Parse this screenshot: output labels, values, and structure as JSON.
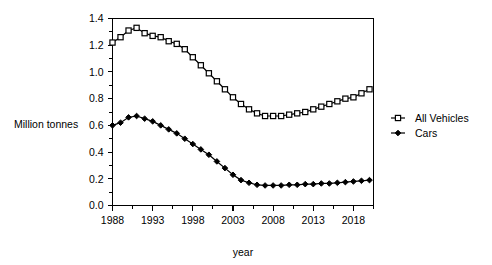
{
  "chart_data": {
    "type": "line",
    "title": "",
    "xlabel": "year",
    "ylabel": "Million tonnes",
    "xlim": [
      1988,
      2020.5
    ],
    "ylim": [
      0.0,
      1.4
    ],
    "grid": false,
    "legend_position": "right",
    "x_ticks": [
      "1988",
      "1993",
      "1998",
      "2003",
      "2008",
      "2013",
      "2018"
    ],
    "x_tick_values": [
      1988,
      1993,
      1998,
      2003,
      2008,
      2013,
      2018
    ],
    "x_minor_step": 2.5,
    "y_ticks": [
      "0.0",
      "0.2",
      "0.4",
      "0.6",
      "0.8",
      "1.0",
      "1.2",
      "1.4"
    ],
    "y_tick_values": [
      0.0,
      0.2,
      0.4,
      0.6,
      0.8,
      1.0,
      1.2,
      1.4
    ],
    "y_minor_step": 0.1,
    "x": [
      1988,
      1989,
      1990,
      1991,
      1992,
      1993,
      1994,
      1995,
      1996,
      1997,
      1998,
      1999,
      2000,
      2001,
      2002,
      2003,
      2004,
      2005,
      2006,
      2007,
      2008,
      2009,
      2010,
      2011,
      2012,
      2013,
      2014,
      2015,
      2016,
      2017,
      2018,
      2019,
      2020
    ],
    "series": [
      {
        "name": "All Vehicles",
        "marker": "open-square",
        "color": "#000000",
        "values": [
          1.22,
          1.26,
          1.31,
          1.33,
          1.29,
          1.27,
          1.26,
          1.23,
          1.21,
          1.17,
          1.11,
          1.05,
          0.99,
          0.93,
          0.87,
          0.81,
          0.76,
          0.72,
          0.69,
          0.67,
          0.67,
          0.67,
          0.68,
          0.69,
          0.7,
          0.72,
          0.74,
          0.76,
          0.78,
          0.8,
          0.81,
          0.84,
          0.87
        ]
      },
      {
        "name": "Cars",
        "marker": "filled-diamond",
        "color": "#000000",
        "values": [
          0.6,
          0.62,
          0.66,
          0.67,
          0.65,
          0.63,
          0.6,
          0.57,
          0.54,
          0.5,
          0.46,
          0.42,
          0.38,
          0.33,
          0.28,
          0.23,
          0.19,
          0.17,
          0.155,
          0.15,
          0.15,
          0.15,
          0.155,
          0.155,
          0.16,
          0.16,
          0.165,
          0.165,
          0.17,
          0.175,
          0.18,
          0.185,
          0.19
        ]
      }
    ]
  },
  "legend": {
    "items": [
      {
        "label": "All Vehicles",
        "marker": "open-square"
      },
      {
        "label": "Cars",
        "marker": "filled-diamond"
      }
    ]
  }
}
